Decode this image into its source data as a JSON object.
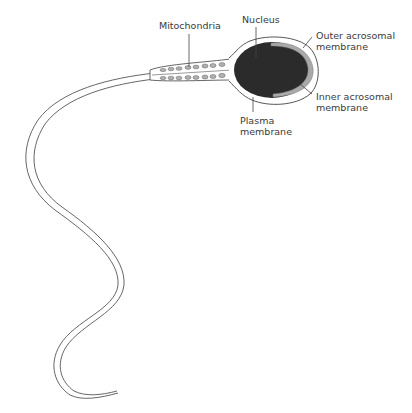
{
  "diagram": {
    "colors": {
      "outline": "#444444",
      "nucleus": "#2b2b2b",
      "acrosome": "#a9a9a9",
      "mitochondria": "#b0b0b0",
      "background": "#ffffff"
    },
    "labels": {
      "mitochondria": {
        "line1": "Mitochondria"
      },
      "nucleus": {
        "line1": "Nucleus"
      },
      "outer_acrosomal": {
        "line1": "Outer acrosomal",
        "line2": "membrane"
      },
      "inner_acrosomal": {
        "line1": "Inner acrosomal",
        "line2": "membrane"
      },
      "plasma": {
        "line1": "Plasma",
        "line2": "membrane"
      }
    }
  }
}
